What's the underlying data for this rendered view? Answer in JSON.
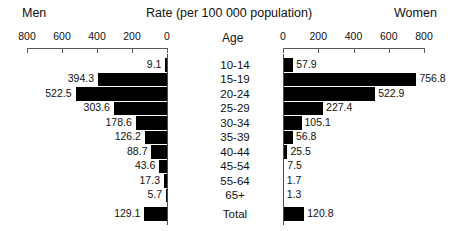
{
  "header": {
    "men_label": "Men",
    "women_label": "Women",
    "title": "Rate (per 100 000 population)",
    "age_header": "Age"
  },
  "axis": {
    "left_ticks": [
      "800",
      "600",
      "400",
      "200",
      "0"
    ],
    "right_ticks": [
      "0",
      "200",
      "400",
      "600",
      "800"
    ],
    "max": 800
  },
  "chart_data": {
    "type": "bar",
    "title": "Rate (per 100 000 population)",
    "xlabel": "Rate (per 100 000 population)",
    "ylabel": "Age",
    "xlim": [
      0,
      800
    ],
    "grid": false,
    "legend": [
      "Men",
      "Women"
    ],
    "legend_position": "top-outside",
    "orientation": "horizontal",
    "layout": "population-pyramid",
    "categories": [
      "10-14",
      "15-19",
      "20-24",
      "25-29",
      "30-34",
      "35-39",
      "40-44",
      "45-54",
      "55-64",
      "65+",
      "Total"
    ],
    "series": [
      {
        "name": "Men",
        "side": "left",
        "values": [
          9.1,
          394.3,
          522.5,
          303.6,
          178.6,
          126.2,
          88.7,
          43.6,
          17.3,
          5.7,
          129.1
        ]
      },
      {
        "name": "Women",
        "side": "right",
        "values": [
          57.9,
          756.8,
          522.9,
          227.4,
          105.1,
          56.8,
          25.5,
          7.5,
          1.7,
          1.3,
          120.8
        ]
      }
    ],
    "labels": {
      "men": [
        "9.1",
        "394.3",
        "522.5",
        "303.6",
        "178.6",
        "126.2",
        "88.7",
        "43.6",
        "17.3",
        "5.7",
        "129.1"
      ],
      "women": [
        "57.9",
        "756.8",
        "522.9",
        "227.4",
        "105.1",
        "56.8",
        "25.5",
        "7.5",
        "1.7",
        "1.3",
        "120.8"
      ]
    }
  },
  "colors": {
    "bar": "#000000",
    "axis": "#4d4d4d",
    "text": "#111111",
    "background": "#ffffff"
  }
}
